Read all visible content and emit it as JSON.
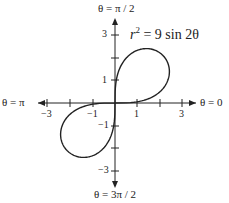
{
  "chart_data": {
    "type": "line",
    "equation": "r² = 9 sin 2θ",
    "curve": "lemniscate",
    "axes": {
      "top": "θ = π / 2",
      "bottom": "θ = 3π / 2",
      "left": "θ = π",
      "right": "θ = 0"
    },
    "x_ticks": [
      -3,
      -2,
      -1,
      1,
      2,
      3
    ],
    "x_tick_labels": [
      "-3",
      "-1",
      "1",
      "3"
    ],
    "y_ticks": [
      -3,
      -2,
      -1,
      1,
      2,
      3
    ],
    "y_tick_labels": [
      "3",
      "1",
      "-1",
      "-3"
    ],
    "xlim": [
      -4,
      4
    ],
    "ylim": [
      -4,
      4
    ],
    "grid": false
  },
  "labels": {
    "top": "θ = π / 2",
    "bottom": "θ = 3π / 2",
    "left": "θ = π",
    "right": "θ = 0",
    "eq_r": "r",
    "eq_rest": " = 9 sin 2θ",
    "eq_exp": "2",
    "xt_m3": "−3",
    "xt_m1": "−1",
    "xt_1": "1",
    "xt_3": "3",
    "yt_3": "3",
    "yt_1": "1",
    "yt_m1": "−1",
    "yt_m3": "−3"
  }
}
